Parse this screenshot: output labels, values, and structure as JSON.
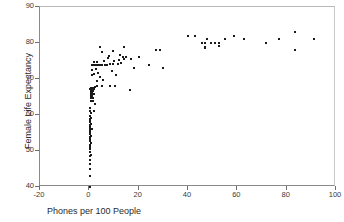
{
  "chart_data": {
    "type": "scatter",
    "title": "",
    "xlabel": "Phones per 100 People",
    "ylabel": "Female Life Expectancy",
    "xlim": [
      -20,
      100
    ],
    "ylim": [
      40,
      90
    ],
    "xticks": [
      -20,
      0,
      20,
      40,
      60,
      80,
      100
    ],
    "yticks": [
      40,
      50,
      60,
      70,
      80,
      90
    ],
    "grid": false,
    "legend": null,
    "marker": {
      "shape": "square",
      "color": "#1a1a1a",
      "size_px": 2
    },
    "series": [
      {
        "name": "Countries",
        "points": [
          [
            0.2,
            40.0
          ],
          [
            0.3,
            43.0
          ],
          [
            0.2,
            45.0
          ],
          [
            0.4,
            46.5
          ],
          [
            0.3,
            47.5
          ],
          [
            0.2,
            48.5
          ],
          [
            0.5,
            49.0
          ],
          [
            0.3,
            49.8
          ],
          [
            0.2,
            50.5
          ],
          [
            0.4,
            51.0
          ],
          [
            0.3,
            51.8
          ],
          [
            0.5,
            52.3
          ],
          [
            0.2,
            52.8
          ],
          [
            0.4,
            53.3
          ],
          [
            0.3,
            53.8
          ],
          [
            0.6,
            54.2
          ],
          [
            0.2,
            54.7
          ],
          [
            0.4,
            55.2
          ],
          [
            0.3,
            55.6
          ],
          [
            0.8,
            56.0
          ],
          [
            1.2,
            56.0
          ],
          [
            0.3,
            56.0
          ],
          [
            0.5,
            56.0
          ],
          [
            0.2,
            56.4
          ],
          [
            0.4,
            56.8
          ],
          [
            0.3,
            57.2
          ],
          [
            0.5,
            57.6
          ],
          [
            0.2,
            58.0
          ],
          [
            0.4,
            58.4
          ],
          [
            0.3,
            58.9
          ],
          [
            0.6,
            59.3
          ],
          [
            0.2,
            59.8
          ],
          [
            0.5,
            60.5
          ],
          [
            0.3,
            61.2
          ],
          [
            1.8,
            61.0
          ],
          [
            0.4,
            62.0
          ],
          [
            2.2,
            63.0
          ],
          [
            1.0,
            63.8
          ],
          [
            0.6,
            64.0
          ],
          [
            1.1,
            64.0
          ],
          [
            1.6,
            64.0
          ],
          [
            0.5,
            64.6
          ],
          [
            1.0,
            64.8
          ],
          [
            1.5,
            64.8
          ],
          [
            0.6,
            65.3
          ],
          [
            1.2,
            65.3
          ],
          [
            0.5,
            65.8
          ],
          [
            1.1,
            65.8
          ],
          [
            1.7,
            65.8
          ],
          [
            0.6,
            66.3
          ],
          [
            1.2,
            66.3
          ],
          [
            0.5,
            66.8
          ],
          [
            1.0,
            66.8
          ],
          [
            1.6,
            66.8
          ],
          [
            0.4,
            67.2
          ],
          [
            0.9,
            67.2
          ],
          [
            1.4,
            67.2
          ],
          [
            2.0,
            67.2
          ],
          [
            0.5,
            67.6
          ],
          [
            1.1,
            67.6
          ],
          [
            1.8,
            67.6
          ],
          [
            2.4,
            67.8
          ],
          [
            3.2,
            68.0
          ],
          [
            5.0,
            68.0
          ],
          [
            8.5,
            68.0
          ],
          [
            10.5,
            68.0
          ],
          [
            16.5,
            67.0
          ],
          [
            3.0,
            69.5
          ],
          [
            5.5,
            69.8
          ],
          [
            4.2,
            70.5
          ],
          [
            11.0,
            71.0
          ],
          [
            1.2,
            71.2
          ],
          [
            2.0,
            71.5
          ],
          [
            3.5,
            71.8
          ],
          [
            9.0,
            72.3
          ],
          [
            1.0,
            72.5
          ],
          [
            2.6,
            72.8
          ],
          [
            18.0,
            73.0
          ],
          [
            30.0,
            73.0
          ],
          [
            24.0,
            74.0
          ],
          [
            1.0,
            74.0
          ],
          [
            1.6,
            74.0
          ],
          [
            2.2,
            74.0
          ],
          [
            2.8,
            74.0
          ],
          [
            3.6,
            74.0
          ],
          [
            4.4,
            74.0
          ],
          [
            5.2,
            74.0
          ],
          [
            6.2,
            74.0
          ],
          [
            7.2,
            74.0
          ],
          [
            8.2,
            74.2
          ],
          [
            9.5,
            74.2
          ],
          [
            11.5,
            74.2
          ],
          [
            13.0,
            74.5
          ],
          [
            1.8,
            74.8
          ],
          [
            3.0,
            74.8
          ],
          [
            6.0,
            75.0
          ],
          [
            10.0,
            75.0
          ],
          [
            12.0,
            75.3
          ],
          [
            14.0,
            75.5
          ],
          [
            7.5,
            75.8
          ],
          [
            13.5,
            76.0
          ],
          [
            15.0,
            76.0
          ],
          [
            20.0,
            76.0
          ],
          [
            17.0,
            75.5
          ],
          [
            8.0,
            76.5
          ],
          [
            12.5,
            76.8
          ],
          [
            5.0,
            77.5
          ],
          [
            9.5,
            77.8
          ],
          [
            4.5,
            79.0
          ],
          [
            14.0,
            79.0
          ],
          [
            27.0,
            78.0
          ],
          [
            28.5,
            78.0
          ],
          [
            40.0,
            82.0
          ],
          [
            43.0,
            82.0
          ],
          [
            45.5,
            80.0
          ],
          [
            47.0,
            80.0
          ],
          [
            47.0,
            79.0
          ],
          [
            47.0,
            78.5
          ],
          [
            47.5,
            81.0
          ],
          [
            49.5,
            80.0
          ],
          [
            51.0,
            80.0
          ],
          [
            52.5,
            80.0
          ],
          [
            52.5,
            79.3
          ],
          [
            55.0,
            81.0
          ],
          [
            58.5,
            82.0
          ],
          [
            62.5,
            81.0
          ],
          [
            71.5,
            80.0
          ],
          [
            77.0,
            81.0
          ],
          [
            83.5,
            83.0
          ],
          [
            83.5,
            78.0
          ],
          [
            91.0,
            81.0
          ]
        ]
      }
    ]
  },
  "axes": {
    "y_title": "Female Life Expectancy",
    "x_title": "Phones per 100 People",
    "y_tick_labels": [
      "90",
      "80",
      "70",
      "60",
      "50",
      "40"
    ],
    "x_tick_labels": [
      "-20",
      "0",
      "20",
      "40",
      "60",
      "80",
      "100"
    ]
  }
}
